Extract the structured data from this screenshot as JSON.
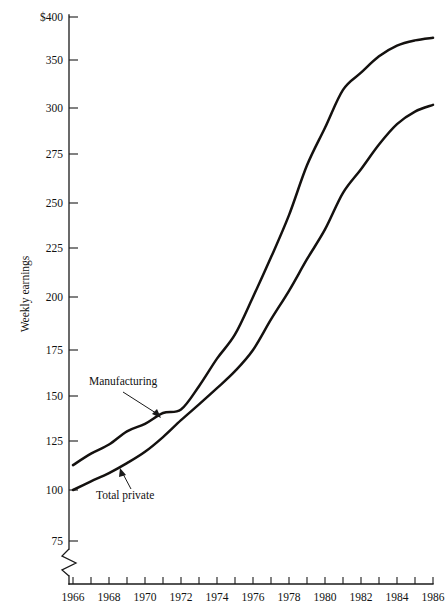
{
  "chart_data": {
    "type": "line",
    "title": "",
    "xlabel": "",
    "ylabel": "Weekly earnings",
    "scale": "logarithmic",
    "grid": false,
    "legend_position": "inline-annotations",
    "axis_break": "y-axis broken below 75",
    "xlim": [
      1966,
      1986
    ],
    "ylim": [
      75,
      400
    ],
    "x_tick_interval": 1,
    "x_labeled_interval": 2,
    "x_tick_values": [
      1966,
      1967,
      1968,
      1969,
      1970,
      1971,
      1972,
      1973,
      1974,
      1975,
      1976,
      1977,
      1978,
      1979,
      1980,
      1981,
      1982,
      1983,
      1984,
      1985,
      1986
    ],
    "x_tick_labels": [
      "1966",
      "",
      "1968",
      "",
      "1970",
      "",
      "1972",
      "",
      "1974",
      "",
      "1976",
      "",
      "1978",
      "",
      "1980",
      "",
      "1982",
      "",
      "1984",
      "",
      "1986"
    ],
    "y_ticks": [
      {
        "value": 400,
        "label": "$400",
        "y_px": 17
      },
      {
        "value": 350,
        "label": "350",
        "y_px": 60
      },
      {
        "value": 300,
        "label": "300",
        "y_px": 108
      },
      {
        "value": 275,
        "label": "275",
        "y_px": 154
      },
      {
        "value": 250,
        "label": "250",
        "y_px": 203
      },
      {
        "value": 225,
        "label": "225",
        "y_px": 248
      },
      {
        "value": 200,
        "label": "200",
        "y_px": 297
      },
      {
        "value": 175,
        "label": "175",
        "y_px": 350
      },
      {
        "value": 150,
        "label": "150",
        "y_px": 396
      },
      {
        "value": 125,
        "label": "125",
        "y_px": 441
      },
      {
        "value": 100,
        "label": "100",
        "y_px": 490
      },
      {
        "value": 75,
        "label": "75",
        "y_px": 541
      }
    ],
    "x": [
      1966,
      1967,
      1968,
      1969,
      1970,
      1971,
      1972,
      1973,
      1974,
      1975,
      1976,
      1977,
      1978,
      1979,
      1980,
      1981,
      1982,
      1983,
      1984,
      1985,
      1986
    ],
    "series": [
      {
        "name": "Manufacturing",
        "label": "Manufacturing",
        "values": [
          112,
          118,
          123,
          130,
          134,
          140,
          142,
          155,
          170,
          182,
          200,
          220,
          243,
          269,
          289,
          318,
          336,
          354,
          366,
          372,
          375
        ]
      },
      {
        "name": "Total private",
        "label": "Total private",
        "values": [
          100,
          104,
          108,
          113,
          119,
          127,
          136,
          145,
          154,
          163,
          175,
          189,
          203,
          219,
          235,
          255,
          267,
          280,
          291,
          298,
          303
        ]
      }
    ],
    "annotations": [
      {
        "text": "Manufacturing",
        "target_series": "Manufacturing",
        "label_x_px": 89,
        "label_y_px": 385,
        "arrow_from_px": [
          123,
          392
        ],
        "arrow_to_px": [
          161,
          418
        ]
      },
      {
        "text": "Total private",
        "target_series": "Total private",
        "label_x_px": 96,
        "label_y_px": 496,
        "arrow_from_px": [
          131,
          489
        ],
        "arrow_to_px": [
          120,
          469
        ]
      }
    ]
  }
}
